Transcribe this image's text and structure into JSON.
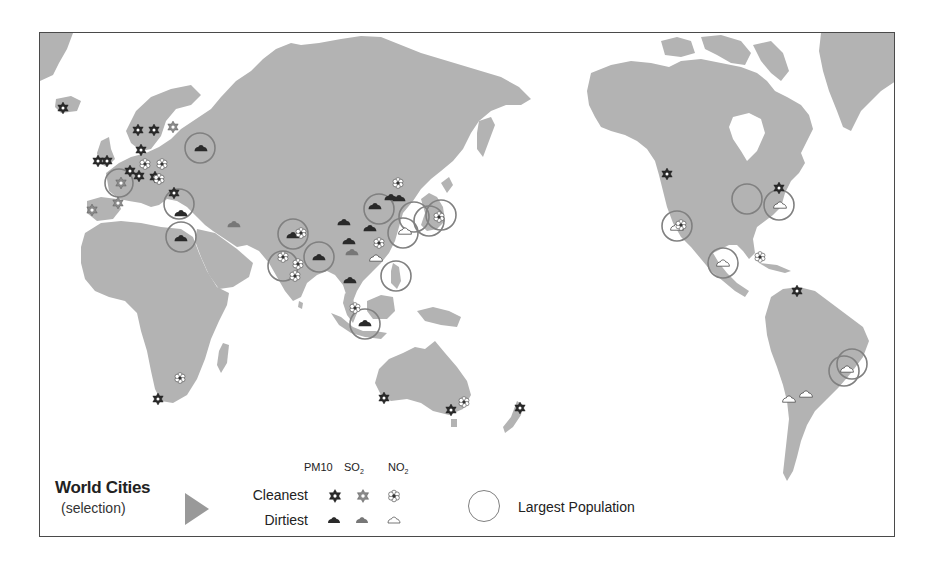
{
  "legend": {
    "title": "World Cities",
    "subtitle": "(selection)",
    "rows": {
      "cleanest": "Cleanest",
      "dirtiest": "Dirtiest"
    },
    "columns": [
      {
        "id": "pm10",
        "label": "PM10",
        "sub": ""
      },
      {
        "id": "so2",
        "label": "SO",
        "sub": "2"
      },
      {
        "id": "no2",
        "label": "NO",
        "sub": "2"
      }
    ],
    "population_label": "Largest Population",
    "symbols": {
      "cleanest_pm10": "dark-star-icon",
      "cleanest_so2": "light-star-icon",
      "cleanest_no2": "outline-flower-icon",
      "dirtiest_pm10": "dark-cloud-icon",
      "dirtiest_so2": "grey-cloud-icon",
      "dirtiest_no2": "outline-cloud-icon"
    }
  },
  "colors": {
    "land": "#b3b3b3",
    "ocean": "#ffffff",
    "frame": "#4a4a4a",
    "pm10": "#2a2a2a",
    "so2": "#8a8a8a",
    "no2_outline": "#555555",
    "population_circle": "#808080",
    "arrow": "#999999"
  },
  "map": {
    "population_circles": [
      {
        "region": "Moscow",
        "x": 199,
        "y": 147
      },
      {
        "region": "Paris",
        "x": 118,
        "y": 182
      },
      {
        "region": "Istanbul",
        "x": 178,
        "y": 203
      },
      {
        "region": "Cairo",
        "x": 180,
        "y": 236
      },
      {
        "region": "Karachi",
        "x": 292,
        "y": 233
      },
      {
        "region": "Mumbai",
        "x": 282,
        "y": 265
      },
      {
        "region": "Dhaka/Kolkata",
        "x": 318,
        "y": 256
      },
      {
        "region": "Beijing",
        "x": 378,
        "y": 208
      },
      {
        "region": "Shanghai",
        "x": 402,
        "y": 232
      },
      {
        "region": "Seoul",
        "x": 412,
        "y": 218
      },
      {
        "region": "Osaka",
        "x": 429,
        "y": 221
      },
      {
        "region": "Tokyo",
        "x": 440,
        "y": 215
      },
      {
        "region": "Manila",
        "x": 395,
        "y": 275
      },
      {
        "region": "Jakarta",
        "x": 364,
        "y": 323
      },
      {
        "region": "Los Angeles",
        "x": 676,
        "y": 225
      },
      {
        "region": "Chicago",
        "x": 746,
        "y": 198
      },
      {
        "region": "New York",
        "x": 778,
        "y": 204
      },
      {
        "region": "Mexico City",
        "x": 722,
        "y": 262
      },
      {
        "region": "Sao Paulo",
        "x": 843,
        "y": 370
      },
      {
        "region": "Rio de Janeiro",
        "x": 851,
        "y": 363
      }
    ],
    "markers": [
      {
        "type": "pm10-clean",
        "x": 62,
        "y": 107
      },
      {
        "type": "pm10-clean",
        "x": 137,
        "y": 129
      },
      {
        "type": "pm10-clean",
        "x": 153,
        "y": 129
      },
      {
        "type": "so2-clean",
        "x": 172,
        "y": 126
      },
      {
        "type": "pm10-clean",
        "x": 140,
        "y": 149
      },
      {
        "type": "pm10-clean",
        "x": 97,
        "y": 160
      },
      {
        "type": "pm10-clean",
        "x": 106,
        "y": 160
      },
      {
        "type": "no2-clean",
        "x": 144,
        "y": 163
      },
      {
        "type": "no2-clean",
        "x": 161,
        "y": 163
      },
      {
        "type": "pm10-clean",
        "x": 129,
        "y": 170
      },
      {
        "type": "pm10-clean",
        "x": 138,
        "y": 175
      },
      {
        "type": "pm10-clean",
        "x": 154,
        "y": 176
      },
      {
        "type": "no2-clean",
        "x": 158,
        "y": 178
      },
      {
        "type": "so2-clean",
        "x": 120,
        "y": 182
      },
      {
        "type": "pm10-clean",
        "x": 173,
        "y": 192
      },
      {
        "type": "so2-clean",
        "x": 117,
        "y": 202
      },
      {
        "type": "so2-clean",
        "x": 91,
        "y": 209
      },
      {
        "type": "pm10-dirty",
        "x": 200,
        "y": 147
      },
      {
        "type": "pm10-dirty",
        "x": 180,
        "y": 212
      },
      {
        "type": "pm10-dirty",
        "x": 180,
        "y": 237
      },
      {
        "type": "so2-dirty",
        "x": 233,
        "y": 223
      },
      {
        "type": "pm10-dirty",
        "x": 292,
        "y": 234
      },
      {
        "type": "no2-clean",
        "x": 300,
        "y": 232
      },
      {
        "type": "no2-clean",
        "x": 282,
        "y": 256
      },
      {
        "type": "no2-clean",
        "x": 297,
        "y": 263
      },
      {
        "type": "no2-clean",
        "x": 294,
        "y": 275
      },
      {
        "type": "pm10-dirty",
        "x": 318,
        "y": 256
      },
      {
        "type": "pm10-dirty",
        "x": 343,
        "y": 221
      },
      {
        "type": "pm10-dirty",
        "x": 348,
        "y": 240
      },
      {
        "type": "so2-dirty",
        "x": 351,
        "y": 251
      },
      {
        "type": "pm10-dirty",
        "x": 374,
        "y": 205
      },
      {
        "type": "pm10-dirty",
        "x": 390,
        "y": 196
      },
      {
        "type": "pm10-dirty",
        "x": 398,
        "y": 197
      },
      {
        "type": "no2-clean",
        "x": 397,
        "y": 182
      },
      {
        "type": "pm10-dirty",
        "x": 369,
        "y": 227
      },
      {
        "type": "no2-clean",
        "x": 378,
        "y": 242
      },
      {
        "type": "no2-dirty",
        "x": 375,
        "y": 257
      },
      {
        "type": "no2-dirty",
        "x": 404,
        "y": 230
      },
      {
        "type": "no2-clean",
        "x": 438,
        "y": 216
      },
      {
        "type": "pm10-dirty",
        "x": 349,
        "y": 279
      },
      {
        "type": "no2-clean",
        "x": 354,
        "y": 307
      },
      {
        "type": "pm10-dirty",
        "x": 364,
        "y": 322
      },
      {
        "type": "pm10-clean",
        "x": 157,
        "y": 398
      },
      {
        "type": "no2-clean",
        "x": 179,
        "y": 377
      },
      {
        "type": "pm10-clean",
        "x": 383,
        "y": 397
      },
      {
        "type": "pm10-clean",
        "x": 450,
        "y": 409
      },
      {
        "type": "no2-clean",
        "x": 463,
        "y": 401
      },
      {
        "type": "pm10-clean",
        "x": 519,
        "y": 407
      },
      {
        "type": "pm10-clean",
        "x": 666,
        "y": 173
      },
      {
        "type": "no2-dirty",
        "x": 676,
        "y": 226
      },
      {
        "type": "no2-clean",
        "x": 680,
        "y": 224
      },
      {
        "type": "pm10-clean",
        "x": 778,
        "y": 187
      },
      {
        "type": "no2-dirty",
        "x": 779,
        "y": 204
      },
      {
        "type": "no2-dirty",
        "x": 722,
        "y": 262
      },
      {
        "type": "no2-clean",
        "x": 759,
        "y": 256
      },
      {
        "type": "pm10-clean",
        "x": 796,
        "y": 290
      },
      {
        "type": "no2-dirty",
        "x": 846,
        "y": 368
      },
      {
        "type": "no2-dirty",
        "x": 788,
        "y": 398
      },
      {
        "type": "no2-dirty",
        "x": 805,
        "y": 393
      }
    ]
  }
}
